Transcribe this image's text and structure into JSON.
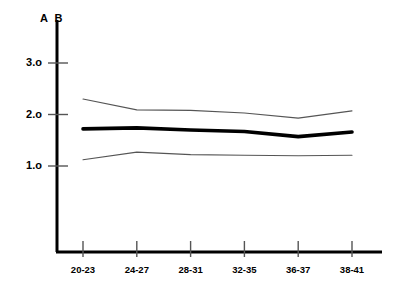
{
  "chart_data": {
    "type": "line",
    "title": "",
    "subtitle": "",
    "xlabel": "",
    "ylabel": "A B",
    "axis_corner_label": "A B",
    "categories": [
      "20-23",
      "24-27",
      "28-31",
      "32-35",
      "36-37",
      "38-41"
    ],
    "ytick_labels": [
      "3.o",
      "2.o",
      "1.o"
    ],
    "ytick_values": [
      3.0,
      2.0,
      1.0
    ],
    "ylim": [
      0,
      3.35
    ],
    "xlim": [
      0,
      7
    ],
    "grid": false,
    "legend": "none",
    "series": [
      {
        "name": "upper-band",
        "style": "thin",
        "color": "#555555",
        "values": [
          2.3,
          2.09,
          2.08,
          2.03,
          1.93,
          2.07
        ]
      },
      {
        "name": "mean-line",
        "style": "thick",
        "color": "#000000",
        "values": [
          1.72,
          1.74,
          1.7,
          1.67,
          1.57,
          1.66
        ]
      },
      {
        "name": "lower-band",
        "style": "thin",
        "color": "#555555",
        "values": [
          1.12,
          1.27,
          1.22,
          1.21,
          1.2,
          1.21
        ]
      }
    ]
  },
  "axes": {
    "y_axis_name": "y-axis",
    "x_axis_name": "x-axis"
  }
}
